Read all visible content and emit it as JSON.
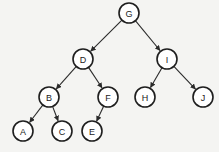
{
  "diagram": {
    "type": "binary-tree",
    "colors": {
      "stroke": "#1e1e1e",
      "node_fill": "#ffffff",
      "background": "#f4f4f2"
    },
    "nodes": [
      {
        "id": "G",
        "label": "G",
        "x": 129,
        "y": 13
      },
      {
        "id": "D",
        "label": "D",
        "x": 83,
        "y": 59
      },
      {
        "id": "I",
        "label": "I",
        "x": 167,
        "y": 59
      },
      {
        "id": "B",
        "label": "B",
        "x": 49,
        "y": 97
      },
      {
        "id": "F",
        "label": "F",
        "x": 108,
        "y": 97
      },
      {
        "id": "H",
        "label": "H",
        "x": 145,
        "y": 97
      },
      {
        "id": "J",
        "label": "J",
        "x": 203,
        "y": 97
      },
      {
        "id": "A",
        "label": "A",
        "x": 23,
        "y": 131
      },
      {
        "id": "C",
        "label": "C",
        "x": 62,
        "y": 131
      },
      {
        "id": "E",
        "label": "E",
        "x": 92,
        "y": 131
      }
    ],
    "edges": [
      {
        "from": "G",
        "to": "D"
      },
      {
        "from": "G",
        "to": "I"
      },
      {
        "from": "D",
        "to": "B"
      },
      {
        "from": "D",
        "to": "F"
      },
      {
        "from": "I",
        "to": "H"
      },
      {
        "from": "I",
        "to": "J"
      },
      {
        "from": "B",
        "to": "A"
      },
      {
        "from": "B",
        "to": "C"
      },
      {
        "from": "F",
        "to": "E"
      }
    ],
    "node_radius": 10
  }
}
